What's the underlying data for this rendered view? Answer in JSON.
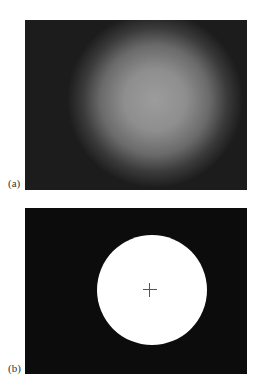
{
  "figure": {
    "panels": [
      {
        "id": "a",
        "label": "(a)",
        "description": "blurred grayscale glow, bright center fading to dark"
      },
      {
        "id": "b",
        "label": "(b)",
        "description": "binary thresholded white disc on black with center crosshair"
      }
    ],
    "colors": {
      "background": "#141414",
      "disc": "#ffffff",
      "glow_peak": "#9c9c9c",
      "crosshair": "#555555"
    }
  }
}
